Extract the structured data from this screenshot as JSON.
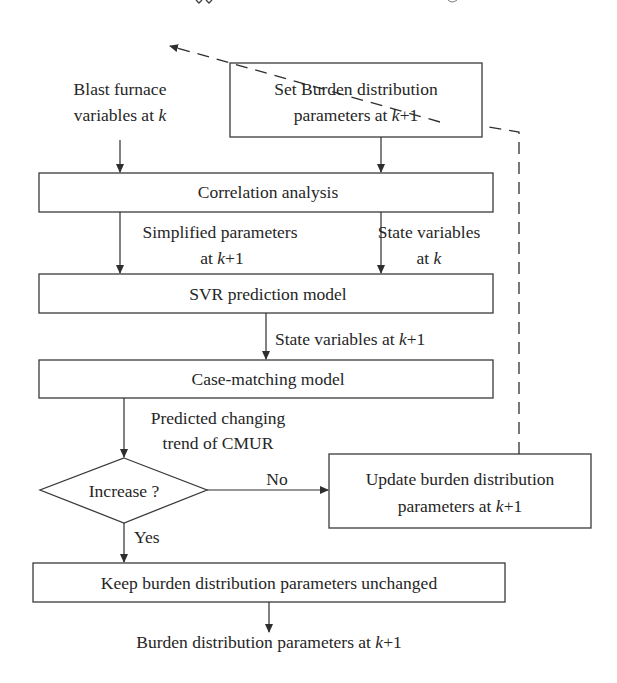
{
  "diagram": {
    "type": "flowchart",
    "top_partial_text": "application flow continued",
    "nodes": {
      "set_burden": {
        "line1": "Set Burden distribution",
        "line2_prefix": "parameters at ",
        "line2_var": "k",
        "line2_suffix": "+1"
      },
      "blast_furnace": {
        "line1": "Blast furnace",
        "line2_prefix": "variables at ",
        "line2_var": "k"
      },
      "correlation": {
        "label": "Correlation analysis"
      },
      "svr": {
        "label": "SVR prediction model"
      },
      "case_matching": {
        "label": "Case-matching model"
      },
      "decision": {
        "label": "Increase ?"
      },
      "update": {
        "line1": "Update burden distribution",
        "line2_prefix": "parameters at ",
        "line2_var": "k",
        "line2_suffix": "+1"
      },
      "keep": {
        "label": "Keep burden distribution parameters unchanged"
      },
      "output": {
        "prefix": "Burden distribution parameters at ",
        "var": "k",
        "suffix": "+1"
      }
    },
    "edge_labels": {
      "simplified": {
        "line1": "Simplified parameters",
        "line2_prefix": "at ",
        "line2_var": "k",
        "line2_suffix": "+1"
      },
      "state_k": {
        "line1": "State variables",
        "line2_prefix": "at ",
        "line2_var": "k"
      },
      "state_k1": {
        "prefix": "State variables at ",
        "var": "k",
        "suffix": "+1"
      },
      "predicted": {
        "line1": "Predicted changing",
        "line2": "trend of CMUR"
      },
      "no": "No",
      "yes": "Yes"
    },
    "colors": {
      "stroke": "#2e2e2e",
      "text": "#262626",
      "background": "#ffffff"
    }
  }
}
